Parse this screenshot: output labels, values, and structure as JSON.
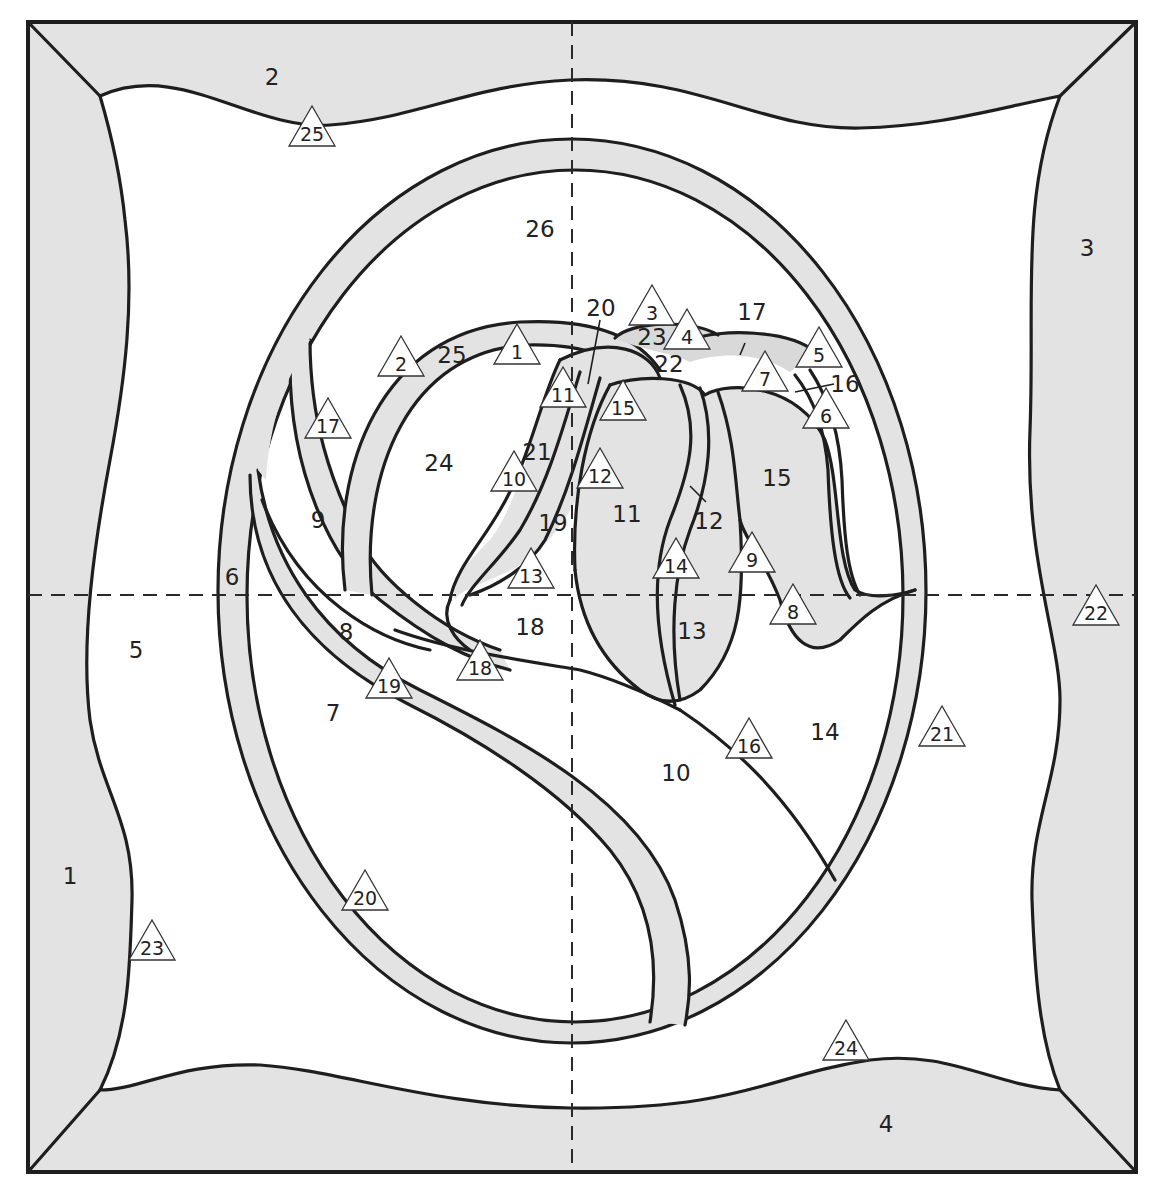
{
  "diagram": {
    "title": "",
    "type": "stained-glass pattern",
    "colors": {
      "line": "#1e1e1e",
      "shaded_glass": "#e3e3e3",
      "clear_glass": "#ffffff",
      "marker_fill": "#ffffff"
    },
    "guides": {
      "vertical_center_dashed": true,
      "horizontal_center_dashed": true
    },
    "piece_labels": [
      {
        "id": "p1",
        "text": "1",
        "x": 70,
        "y": 877
      },
      {
        "id": "p2",
        "text": "2",
        "x": 272,
        "y": 78
      },
      {
        "id": "p3",
        "text": "3",
        "x": 1087,
        "y": 249
      },
      {
        "id": "p4",
        "text": "4",
        "x": 886,
        "y": 1125
      },
      {
        "id": "p5",
        "text": "5",
        "x": 136,
        "y": 651
      },
      {
        "id": "p6",
        "text": "6",
        "x": 232,
        "y": 578
      },
      {
        "id": "p7",
        "text": "7",
        "x": 333,
        "y": 714
      },
      {
        "id": "p8",
        "text": "8",
        "x": 346,
        "y": 633
      },
      {
        "id": "p9",
        "text": "9",
        "x": 318,
        "y": 521
      },
      {
        "id": "p10",
        "text": "10",
        "x": 676,
        "y": 774
      },
      {
        "id": "p11",
        "text": "11",
        "x": 627,
        "y": 515
      },
      {
        "id": "p12",
        "text": "12",
        "x": 709,
        "y": 522
      },
      {
        "id": "p13",
        "text": "13",
        "x": 692,
        "y": 632
      },
      {
        "id": "p14",
        "text": "14",
        "x": 825,
        "y": 733
      },
      {
        "id": "p15",
        "text": "15",
        "x": 777,
        "y": 479
      },
      {
        "id": "p16",
        "text": "16",
        "x": 845,
        "y": 385
      },
      {
        "id": "p17",
        "text": "17",
        "x": 752,
        "y": 313
      },
      {
        "id": "p18",
        "text": "18",
        "x": 530,
        "y": 628
      },
      {
        "id": "p19",
        "text": "19",
        "x": 553,
        "y": 524
      },
      {
        "id": "p20",
        "text": "20",
        "x": 601,
        "y": 309
      },
      {
        "id": "p21",
        "text": "21",
        "x": 537,
        "y": 453
      },
      {
        "id": "p22",
        "text": "22",
        "x": 669,
        "y": 365
      },
      {
        "id": "p23",
        "text": "23",
        "x": 652,
        "y": 338
      },
      {
        "id": "p24",
        "text": "24",
        "x": 439,
        "y": 464
      },
      {
        "id": "p25",
        "text": "25",
        "x": 452,
        "y": 356
      },
      {
        "id": "p26",
        "text": "26",
        "x": 540,
        "y": 230
      }
    ],
    "markers": [
      {
        "id": "m1",
        "text": "1",
        "x": 517,
        "y": 350
      },
      {
        "id": "m2",
        "text": "2",
        "x": 401,
        "y": 362
      },
      {
        "id": "m3",
        "text": "3",
        "x": 652,
        "y": 311
      },
      {
        "id": "m4",
        "text": "4",
        "x": 687,
        "y": 335
      },
      {
        "id": "m5",
        "text": "5",
        "x": 819,
        "y": 353
      },
      {
        "id": "m6",
        "text": "6",
        "x": 826,
        "y": 414
      },
      {
        "id": "m7",
        "text": "7",
        "x": 765,
        "y": 377
      },
      {
        "id": "m8",
        "text": "8",
        "x": 793,
        "y": 610
      },
      {
        "id": "m9",
        "text": "9",
        "x": 752,
        "y": 558
      },
      {
        "id": "m10",
        "text": "10",
        "x": 514,
        "y": 477
      },
      {
        "id": "m11",
        "text": "11",
        "x": 563,
        "y": 393
      },
      {
        "id": "m12",
        "text": "12",
        "x": 600,
        "y": 474
      },
      {
        "id": "m13",
        "text": "13",
        "x": 531,
        "y": 574
      },
      {
        "id": "m14",
        "text": "14",
        "x": 676,
        "y": 564
      },
      {
        "id": "m15",
        "text": "15",
        "x": 623,
        "y": 406
      },
      {
        "id": "m16",
        "text": "16",
        "x": 749,
        "y": 744
      },
      {
        "id": "m17",
        "text": "17",
        "x": 328,
        "y": 424
      },
      {
        "id": "m18",
        "text": "18",
        "x": 480,
        "y": 666
      },
      {
        "id": "m19",
        "text": "19",
        "x": 389,
        "y": 684
      },
      {
        "id": "m20",
        "text": "20",
        "x": 365,
        "y": 896
      },
      {
        "id": "m21",
        "text": "21",
        "x": 942,
        "y": 732
      },
      {
        "id": "m22",
        "text": "22",
        "x": 1096,
        "y": 611
      },
      {
        "id": "m23",
        "text": "23",
        "x": 152,
        "y": 946
      },
      {
        "id": "m24",
        "text": "24",
        "x": 846,
        "y": 1046
      },
      {
        "id": "m25",
        "text": "25",
        "x": 312,
        "y": 132
      }
    ]
  }
}
